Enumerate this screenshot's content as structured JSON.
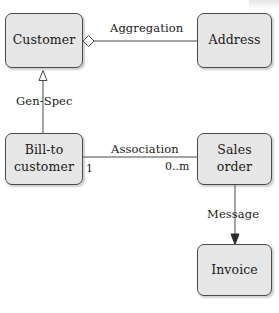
{
  "diagram": {
    "style": {
      "box_fill": "#e6e6e6",
      "box_stroke": "#4a4a4a",
      "line_stroke": "#4a4a4a",
      "text_color": "#1a1a1a",
      "background": "#ffffff"
    },
    "nodes": [
      {
        "id": "customer",
        "label": "Customer",
        "x": 5,
        "y": 13,
        "w": 78,
        "h": 55
      },
      {
        "id": "address",
        "label": "Address",
        "x": 197,
        "y": 13,
        "w": 75,
        "h": 55
      },
      {
        "id": "bill_to",
        "label": "Bill-to\ncustomer",
        "x": 5,
        "y": 133,
        "w": 78,
        "h": 52
      },
      {
        "id": "sales_order",
        "label": "Sales order",
        "x": 197,
        "y": 133,
        "w": 75,
        "h": 52
      },
      {
        "id": "invoice",
        "label": "Invoice",
        "x": 197,
        "y": 244,
        "w": 75,
        "h": 52
      }
    ],
    "edges": [
      {
        "id": "aggregation",
        "label": "Aggregation",
        "from": "customer",
        "to": "address",
        "kind": "aggregation",
        "decoration": "hollow-diamond",
        "label_x": 110,
        "label_y": 22
      },
      {
        "id": "gen-spec",
        "label": "Gen-Spec",
        "from": "bill_to",
        "to": "customer",
        "kind": "generalization",
        "decoration": "hollow-triangle",
        "label_x": 16,
        "label_y": 95
      },
      {
        "id": "association",
        "label": "Association",
        "from": "bill_to",
        "to": "sales_order",
        "kind": "association",
        "decoration": "none",
        "label_x": 111,
        "label_y": 143
      },
      {
        "id": "message",
        "label": "Message",
        "from": "sales_order",
        "to": "invoice",
        "kind": "message",
        "decoration": "solid-arrow",
        "label_x": 207,
        "label_y": 208
      }
    ],
    "multiplicities": [
      {
        "id": "mult-bill-to",
        "label": "1",
        "x": 86,
        "y": 162
      },
      {
        "id": "mult-sales-order",
        "label": "0..m",
        "x": 165,
        "y": 160
      }
    ]
  }
}
